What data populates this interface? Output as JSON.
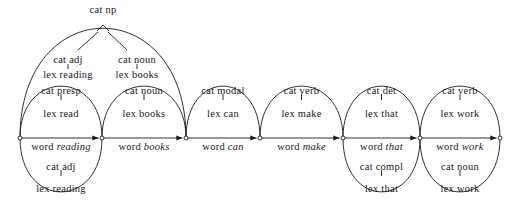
{
  "figure": {
    "background_color": "#ffffff",
    "line_color": "#1a1a1a"
  },
  "chart_data": {
    "type": "diagram",
    "title": "",
    "subtitle": "",
    "xlabel": "",
    "ylabel": "",
    "grid": false,
    "legend": "none",
    "nodes": [
      {
        "id": 0,
        "x": 20,
        "y": 138
      },
      {
        "id": 1,
        "x": 102,
        "y": 138
      },
      {
        "id": 2,
        "x": 186,
        "y": 138
      },
      {
        "id": 3,
        "x": 260,
        "y": 138
      },
      {
        "id": 4,
        "x": 343,
        "y": 138
      },
      {
        "id": 5,
        "x": 420,
        "y": 138
      },
      {
        "id": 6,
        "x": 500,
        "y": 138
      }
    ],
    "baseline_edges": [
      {
        "from": 0,
        "to": 1,
        "prefix": "word",
        "word": "reading"
      },
      {
        "from": 1,
        "to": 2,
        "prefix": "word",
        "word": "books"
      },
      {
        "from": 2,
        "to": 3,
        "prefix": "word",
        "word": "can"
      },
      {
        "from": 3,
        "to": 4,
        "prefix": "word",
        "word": "make"
      },
      {
        "from": 4,
        "to": 5,
        "prefix": "word",
        "word": "that"
      },
      {
        "from": 5,
        "to": 6,
        "prefix": "word",
        "word": "work"
      }
    ],
    "arcs_above": [
      {
        "from": 0,
        "to": 1,
        "cat": "cat  presp",
        "lex": "lex  read",
        "cat_y": 91,
        "lex_y": 114,
        "peak_y": 86
      },
      {
        "from": 1,
        "to": 2,
        "cat": "cat  noun",
        "lex": "lex  books",
        "cat_y": 91,
        "lex_y": 114,
        "peak_y": 86
      },
      {
        "from": 2,
        "to": 3,
        "cat": "cat  modal",
        "lex": "lex  can",
        "cat_y": 91,
        "lex_y": 114,
        "peak_y": 86
      },
      {
        "from": 3,
        "to": 4,
        "cat": "cat  verb",
        "lex": "lex  make",
        "cat_y": 91,
        "lex_y": 114,
        "peak_y": 86
      },
      {
        "from": 4,
        "to": 5,
        "cat": "cat  det",
        "lex": "lex  that",
        "cat_y": 91,
        "lex_y": 114,
        "peak_y": 86
      },
      {
        "from": 5,
        "to": 6,
        "cat": "cat  verb",
        "lex": "lex  work",
        "cat_y": 91,
        "lex_y": 114,
        "peak_y": 86
      }
    ],
    "arcs_below": [
      {
        "from": 0,
        "to": 1,
        "cat": "cat  adj",
        "lex": "lex  reading",
        "cat_y": 167,
        "lex_y": 189,
        "dip_y": 192
      },
      {
        "from": 4,
        "to": 5,
        "cat": "cat compl",
        "lex": "lex  that",
        "cat_y": 167,
        "lex_y": 189,
        "dip_y": 192
      },
      {
        "from": 5,
        "to": 6,
        "cat": "cat  noun",
        "lex": "lex  work",
        "cat_y": 167,
        "lex_y": 189,
        "dip_y": 192
      }
    ],
    "span_arc": {
      "from": 0,
      "to": 2,
      "label": "cat  np",
      "label_x": 103,
      "label_y": 10,
      "apex_x": 103,
      "apex_y": 28,
      "children": [
        {
          "label": "cat  adj",
          "x": 68,
          "y": 56
        },
        {
          "label": "cat  noun",
          "x": 137,
          "y": 56
        }
      ]
    },
    "sub_labels": [
      {
        "text": "cat  adj",
        "x": 68,
        "y": 60,
        "role": "np-child-cat"
      },
      {
        "text": "lex  reading",
        "x": 68,
        "y": 75,
        "role": "np-child-lex"
      },
      {
        "text": "cat  noun",
        "x": 137,
        "y": 60,
        "role": "np-child-cat"
      },
      {
        "text": "lex  books",
        "x": 137,
        "y": 75,
        "role": "np-child-lex"
      }
    ]
  }
}
